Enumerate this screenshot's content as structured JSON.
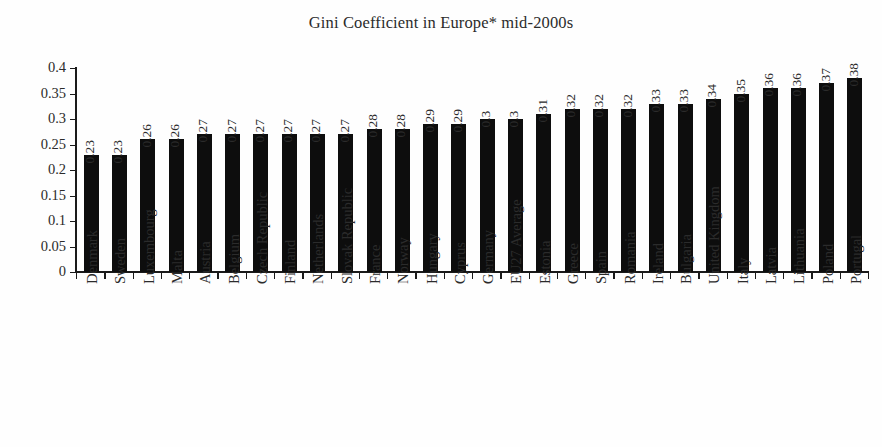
{
  "chart_data": {
    "type": "bar",
    "title": "Gini Coefficient in Europe* mid-2000s",
    "xlabel": "",
    "ylabel": "",
    "ylim": [
      0,
      0.4
    ],
    "ytick_labels": [
      "0.4",
      "0.35",
      "0.3",
      "0.25",
      "0.2",
      "0.15",
      "0.1",
      "0.05",
      "0"
    ],
    "ytick_values": [
      0.4,
      0.35,
      0.3,
      0.25,
      0.2,
      0.15,
      0.1,
      0.05,
      0
    ],
    "grid": false,
    "legend": "none",
    "bar_color": "#0d0d0d",
    "categories": [
      "Denmark",
      "Sweden",
      "Luxembourg",
      "Malta",
      "Austria",
      "Belgium",
      "Czech Republic",
      "Finland",
      "Netherlands",
      "Slovak Republic",
      "France",
      "Norway",
      "Hungary",
      "Cyprus",
      "Germany",
      "EU27 Average",
      "Estonia",
      "Greece",
      "Spain",
      "Romania",
      "Ireland",
      "Bulgaria",
      "United Kingdom",
      "Italy",
      "Latvia",
      "Lithuania",
      "Poland",
      "Portugal"
    ],
    "values": [
      0.23,
      0.23,
      0.26,
      0.26,
      0.27,
      0.27,
      0.27,
      0.27,
      0.27,
      0.27,
      0.28,
      0.28,
      0.29,
      0.29,
      0.3,
      0.3,
      0.31,
      0.32,
      0.32,
      0.32,
      0.33,
      0.33,
      0.34,
      0.35,
      0.36,
      0.36,
      0.37,
      0.38
    ],
    "value_labels": [
      "0.23",
      "0.23",
      "0.26",
      "0.26",
      "0.27",
      "0.27",
      "0.27",
      "0.27",
      "0.27",
      "0.27",
      "0.28",
      "0.28",
      "0.29",
      "0.29",
      "0.3",
      "0.3",
      "0.31",
      "0.32",
      "0.32",
      "0.32",
      "0.33",
      "0.33",
      "0.34",
      "0.35",
      "0.36",
      "0.36",
      "0.37",
      "0.38"
    ]
  }
}
